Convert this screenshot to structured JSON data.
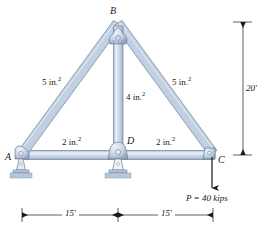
{
  "figure": {
    "colors": {
      "member_fill": "#c3d2e4",
      "member_fill_light": "#dfe7f1",
      "member_edge": "#6b7f98",
      "support_fill": "#b9c6d8",
      "base_plate": "#aab9cd",
      "line": "#1a1a1a"
    }
  },
  "nodes": [
    {
      "id": "A",
      "label": "A",
      "x": 22,
      "y": 155,
      "support": "pin"
    },
    {
      "id": "B",
      "label": "B",
      "x": 118,
      "y": 24,
      "support": "none"
    },
    {
      "id": "C",
      "label": "C",
      "x": 213,
      "y": 155,
      "support": "none"
    },
    {
      "id": "D",
      "label": "D",
      "x": 118,
      "y": 155,
      "support": "pin"
    }
  ],
  "members": [
    {
      "id": "AB",
      "from": "A",
      "to": "B",
      "area_label": "5 in.",
      "area_exp": "2",
      "label_x": 42,
      "label_y": 76
    },
    {
      "id": "BC",
      "from": "B",
      "to": "C",
      "area_label": "5 in.",
      "area_exp": "2",
      "label_x": 172,
      "label_y": 76
    },
    {
      "id": "BD",
      "from": "B",
      "to": "D",
      "area_label": "4 in.",
      "area_exp": "2",
      "label_x": 126,
      "label_y": 93
    },
    {
      "id": "AD",
      "from": "A",
      "to": "D",
      "area_label": "2 in.",
      "area_exp": "2",
      "label_x": 62,
      "label_y": 139
    },
    {
      "id": "DC",
      "from": "D",
      "to": "C",
      "area_label": "2 in.",
      "area_exp": "2",
      "label_x": 156,
      "label_y": 139
    }
  ],
  "load": {
    "label": "P = 40 kips",
    "symbol": "P",
    "value": 40,
    "unit": "kips",
    "applied_at": "C",
    "direction": "down"
  },
  "dimensions": {
    "vertical": {
      "label": "20'",
      "value": 20,
      "unit": "ft"
    },
    "horizontal": [
      {
        "label": "15'",
        "value": 15,
        "unit": "ft",
        "span": "A-D"
      },
      {
        "label": "15'",
        "value": 15,
        "unit": "ft",
        "span": "D-C"
      }
    ]
  }
}
